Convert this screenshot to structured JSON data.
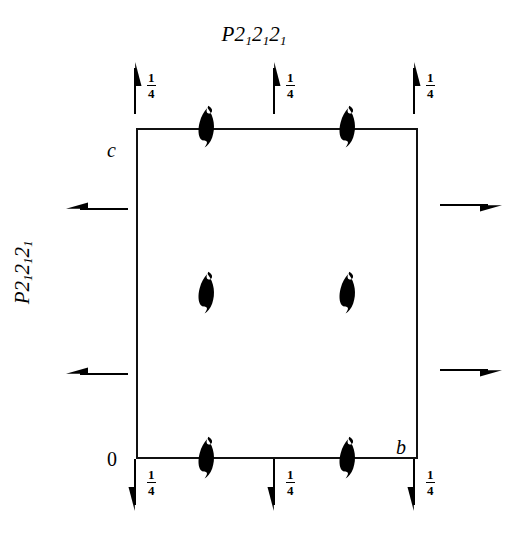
{
  "diagram": {
    "type": "space-group-symmetry-diagram",
    "title_top": "P2₁2₁2₁",
    "title_left": "P2₁2₁2₁",
    "space_group_symbol_parts": {
      "lattice": "P",
      "generators": [
        "2₁",
        "2₁",
        "2₁"
      ]
    },
    "axes": {
      "origin_label": "0",
      "vertical_axis_label": "c",
      "horizontal_axis_label": "b"
    },
    "fraction_label": {
      "numerator": "1",
      "denominator": "4"
    },
    "symbols": {
      "screw_axis_perpendicular": "two-fold-screw-axis-perpendicular-lens",
      "screw_axis_in_plane_horizontal": "two-fold-screw-axis-in-plane-half-arrow",
      "screw_axis_in_plane_vertical": "two-fold-screw-axis-in-plane-half-arrow"
    },
    "colors": {
      "ink": "#111111",
      "background": "#ffffff"
    },
    "screw_axes_perpendicular": [
      {
        "name": "screw-axis-top-left",
        "x_frac": 0.25,
        "y_frac": 0.0
      },
      {
        "name": "screw-axis-top-right",
        "x_frac": 0.75,
        "y_frac": 0.0
      },
      {
        "name": "screw-axis-middle-left",
        "x_frac": 0.25,
        "y_frac": 0.5
      },
      {
        "name": "screw-axis-middle-right",
        "x_frac": 0.75,
        "y_frac": 0.5
      },
      {
        "name": "screw-axis-bottom-left",
        "x_frac": 0.25,
        "y_frac": 1.0
      },
      {
        "name": "screw-axis-bottom-right",
        "x_frac": 0.75,
        "y_frac": 1.0
      }
    ],
    "horizontal_screw_axes": [
      {
        "name": "screw-axis-horizontal-left-upper",
        "side": "left",
        "direction": "left",
        "y_frac": 0.25
      },
      {
        "name": "screw-axis-horizontal-left-lower",
        "side": "left",
        "direction": "left",
        "y_frac": 0.75
      },
      {
        "name": "screw-axis-horizontal-right-upper",
        "side": "right",
        "direction": "right",
        "y_frac": 0.25
      },
      {
        "name": "screw-axis-horizontal-right-lower",
        "side": "right",
        "direction": "right",
        "y_frac": 0.75
      }
    ],
    "vertical_screw_axes": [
      {
        "name": "screw-axis-vertical-top-1",
        "position": "top",
        "direction": "up",
        "height_label": "1/4"
      },
      {
        "name": "screw-axis-vertical-top-2",
        "position": "top",
        "direction": "up",
        "height_label": "1/4"
      },
      {
        "name": "screw-axis-vertical-top-3",
        "position": "top",
        "direction": "up",
        "height_label": "1/4"
      },
      {
        "name": "screw-axis-vertical-bottom-1",
        "position": "bottom",
        "direction": "down",
        "height_label": "1/4"
      },
      {
        "name": "screw-axis-vertical-bottom-2",
        "position": "bottom",
        "direction": "down",
        "height_label": "1/4"
      },
      {
        "name": "screw-axis-vertical-bottom-3",
        "position": "bottom",
        "direction": "down",
        "height_label": "1/4"
      }
    ]
  }
}
